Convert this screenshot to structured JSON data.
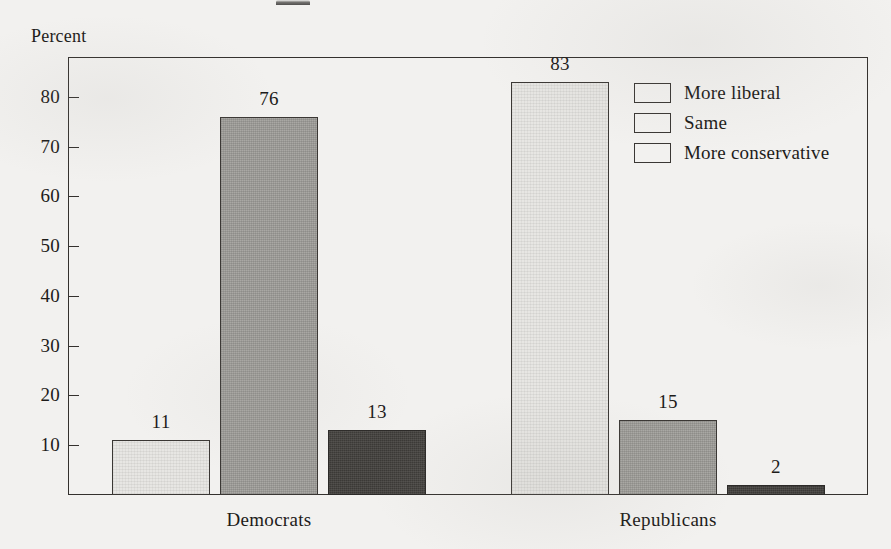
{
  "figure": {
    "y_axis_title": "Percent",
    "top_clipped_fragment": ""
  },
  "chart_data": {
    "type": "bar",
    "title": "",
    "subtitle": "",
    "xlabel": "",
    "ylabel": "Percent",
    "categories": [
      "Democrats",
      "Republicans"
    ],
    "series": [
      {
        "name": "More liberal",
        "color": "#e7e6e3",
        "values": [
          11,
          83
        ]
      },
      {
        "name": "Same",
        "color": "#a9a8a4",
        "values": [
          76,
          15
        ]
      },
      {
        "name": "More conservative",
        "color": "#3b3936",
        "values": [
          13,
          2
        ]
      }
    ],
    "ylim": [
      0,
      88
    ],
    "yticks": [
      10,
      20,
      30,
      40,
      50,
      60,
      70,
      80
    ],
    "ytick_labels": [
      "10",
      "20",
      "30",
      "40",
      "50",
      "60",
      "70",
      "80"
    ],
    "grid": false,
    "legend_position": "upper right",
    "data_labels": true,
    "annotations": []
  },
  "legend": {
    "items": [
      {
        "label": "More liberal",
        "swatch": "light-gray-swatch"
      },
      {
        "label": "Same",
        "swatch": "medium-gray-swatch"
      },
      {
        "label": "More conservative",
        "swatch": "dark-gray-swatch"
      }
    ]
  },
  "bar_labels": {
    "democrats": {
      "more_liberal": "11",
      "same": "76",
      "more_conservative": "13"
    },
    "republicans": {
      "more_liberal": "83",
      "same": "15",
      "more_conservative": "2"
    }
  },
  "category_labels": {
    "first": "Democrats",
    "second": "Republicans"
  },
  "colors": {
    "paper": "#f2f1ef",
    "ink": "#1d1b19",
    "frame": "#34312e",
    "light": "#e7e6e3",
    "medium": "#a9a8a4",
    "dark": "#3b3936"
  }
}
